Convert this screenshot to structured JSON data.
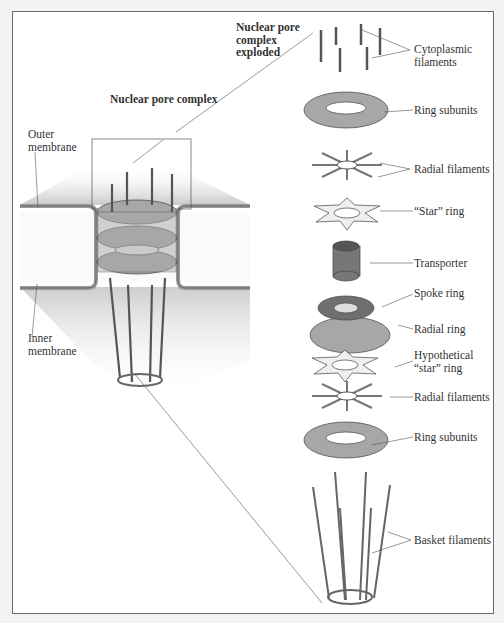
{
  "diagram": {
    "title_left": "Nuclear pore complex",
    "title_right": "Nuclear pore complex exploded",
    "left_labels": {
      "outer_membrane": [
        "Outer",
        "membrane"
      ],
      "inner_membrane": [
        "Inner",
        "membrane"
      ]
    },
    "exploded_labels": [
      {
        "id": "cyto",
        "lines": [
          "Cytoplasmic",
          "filaments"
        ]
      },
      {
        "id": "ring1",
        "lines": [
          "Ring subunits"
        ]
      },
      {
        "id": "radial1",
        "lines": [
          "Radial filaments"
        ]
      },
      {
        "id": "star",
        "lines": [
          "“Star” ring"
        ]
      },
      {
        "id": "transporter",
        "lines": [
          "Transporter"
        ]
      },
      {
        "id": "spoke",
        "lines": [
          "Spoke ring"
        ]
      },
      {
        "id": "radialring",
        "lines": [
          "Radial ring"
        ]
      },
      {
        "id": "hypostar",
        "lines": [
          "Hypothetical",
          "“star” ring"
        ]
      },
      {
        "id": "radial2",
        "lines": [
          "Radial filaments"
        ]
      },
      {
        "id": "ring2",
        "lines": [
          "Ring subunits"
        ]
      },
      {
        "id": "basket",
        "lines": [
          "Basket filaments"
        ]
      }
    ],
    "colors": {
      "background": "#f3f3f3",
      "frame": "#6a6a6a",
      "component_gray": "#a7a7a7",
      "dark_gray": "#6f6f6f",
      "light_fill": "#efefef",
      "membrane": "#9a9a9a"
    }
  }
}
